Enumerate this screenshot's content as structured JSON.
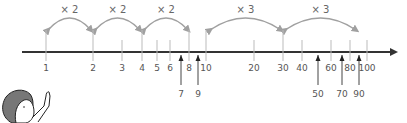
{
  "diagram": {
    "type": "logarithmic-number-line",
    "axis": {
      "y": 52,
      "x_start": 22,
      "x_end": 398,
      "color": "#333333"
    },
    "ticks": [
      {
        "label": "1",
        "x": 46,
        "pos": "above-below",
        "arrow": false
      },
      {
        "label": "2",
        "x": 93,
        "pos": "above-below",
        "arrow": false
      },
      {
        "label": "3",
        "x": 122,
        "pos": "above-below",
        "arrow": false
      },
      {
        "label": "4",
        "x": 142,
        "pos": "above-below",
        "arrow": false
      },
      {
        "label": "5",
        "x": 157,
        "pos": "above-below",
        "arrow": false
      },
      {
        "label": "6",
        "x": 170,
        "pos": "above-below",
        "arrow": false
      },
      {
        "label": "7",
        "x": 181,
        "pos": "above-below",
        "arrow": true
      },
      {
        "label": "8",
        "x": 189,
        "pos": "above-below",
        "arrow": false
      },
      {
        "label": "9",
        "x": 198,
        "pos": "above-below",
        "arrow": true
      },
      {
        "label": "10",
        "x": 206,
        "pos": "above-below",
        "arrow": false
      },
      {
        "label": "20",
        "x": 254,
        "pos": "above-below",
        "arrow": false
      },
      {
        "label": "30",
        "x": 283,
        "pos": "above-below",
        "arrow": false
      },
      {
        "label": "40",
        "x": 302,
        "pos": "above-below",
        "arrow": false
      },
      {
        "label": "50",
        "x": 318,
        "pos": "above-below",
        "arrow": true
      },
      {
        "label": "60",
        "x": 331,
        "pos": "above-below",
        "arrow": false
      },
      {
        "label": "70",
        "x": 342,
        "pos": "above-below",
        "arrow": true
      },
      {
        "label": "80",
        "x": 350,
        "pos": "above-below",
        "arrow": false
      },
      {
        "label": "90",
        "x": 359,
        "pos": "above-below",
        "arrow": true
      },
      {
        "label": "100",
        "x": 367,
        "pos": "above-below",
        "arrow": false
      }
    ],
    "multipliers": [
      {
        "label": "× 2",
        "from_x": 46,
        "to_x": 93
      },
      {
        "label": "× 2",
        "from_x": 93,
        "to_x": 142
      },
      {
        "label": "× 2",
        "from_x": 142,
        "to_x": 190
      },
      {
        "label": "× 3",
        "from_x": 208,
        "to_x": 283
      },
      {
        "label": "× 3",
        "from_x": 283,
        "to_x": 358
      }
    ],
    "character": {
      "description": "person pointing upward",
      "x": 0,
      "y": 88
    }
  }
}
